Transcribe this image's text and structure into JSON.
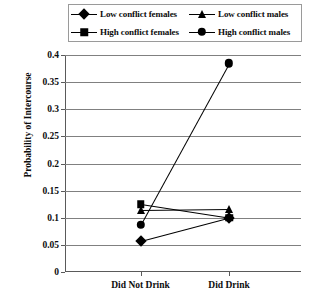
{
  "chart_data": {
    "type": "line",
    "title": "",
    "xlabel": "",
    "ylabel": "Probability of Intercourse",
    "categories": [
      "Did Not Drink",
      "Did Drink"
    ],
    "ylim": [
      0,
      0.4
    ],
    "yticks": [
      "0",
      "0.05",
      "0.1",
      "0.15",
      "0.2",
      "0.25",
      "0.3",
      "0.35",
      "0.4"
    ],
    "ytick_values": [
      0,
      0.05,
      0.1,
      0.15,
      0.2,
      0.25,
      0.3,
      0.35,
      0.4
    ],
    "grid": true,
    "legend_position": "top",
    "series": [
      {
        "name": "Low conflict females",
        "marker": "diamond",
        "values": [
          0.057,
          0.1
        ]
      },
      {
        "name": "High conflict females",
        "marker": "square",
        "values": [
          0.125,
          0.1
        ]
      },
      {
        "name": "Low conflict males",
        "marker": "triangle",
        "values": [
          0.115,
          0.117
        ]
      },
      {
        "name": "High conflict males",
        "marker": "circle",
        "values": [
          0.087,
          0.385
        ]
      }
    ],
    "colors": {
      "line": "#000000",
      "grid": "#808080",
      "axis": "#5a5a5a"
    }
  },
  "legend": {
    "items": [
      {
        "label": "Low conflict females",
        "marker": "diamond"
      },
      {
        "label": "Low conflict males",
        "marker": "triangle"
      },
      {
        "label": "High conflict females",
        "marker": "square"
      },
      {
        "label": "High conflict males",
        "marker": "circle"
      }
    ]
  }
}
